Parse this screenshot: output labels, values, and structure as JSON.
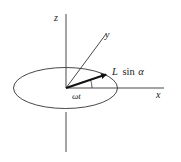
{
  "diagram": {
    "type": "3d-axes-precession",
    "labels": {
      "z_axis": "z",
      "y_axis": "y",
      "x_axis": "x",
      "vector": "L sin α",
      "vector_L": "L",
      "vector_sin": "sin",
      "vector_alpha": "α",
      "angle": "ωt"
    },
    "colors": {
      "line": "#333333",
      "vector": "#111111",
      "background": "#ffffff"
    }
  }
}
